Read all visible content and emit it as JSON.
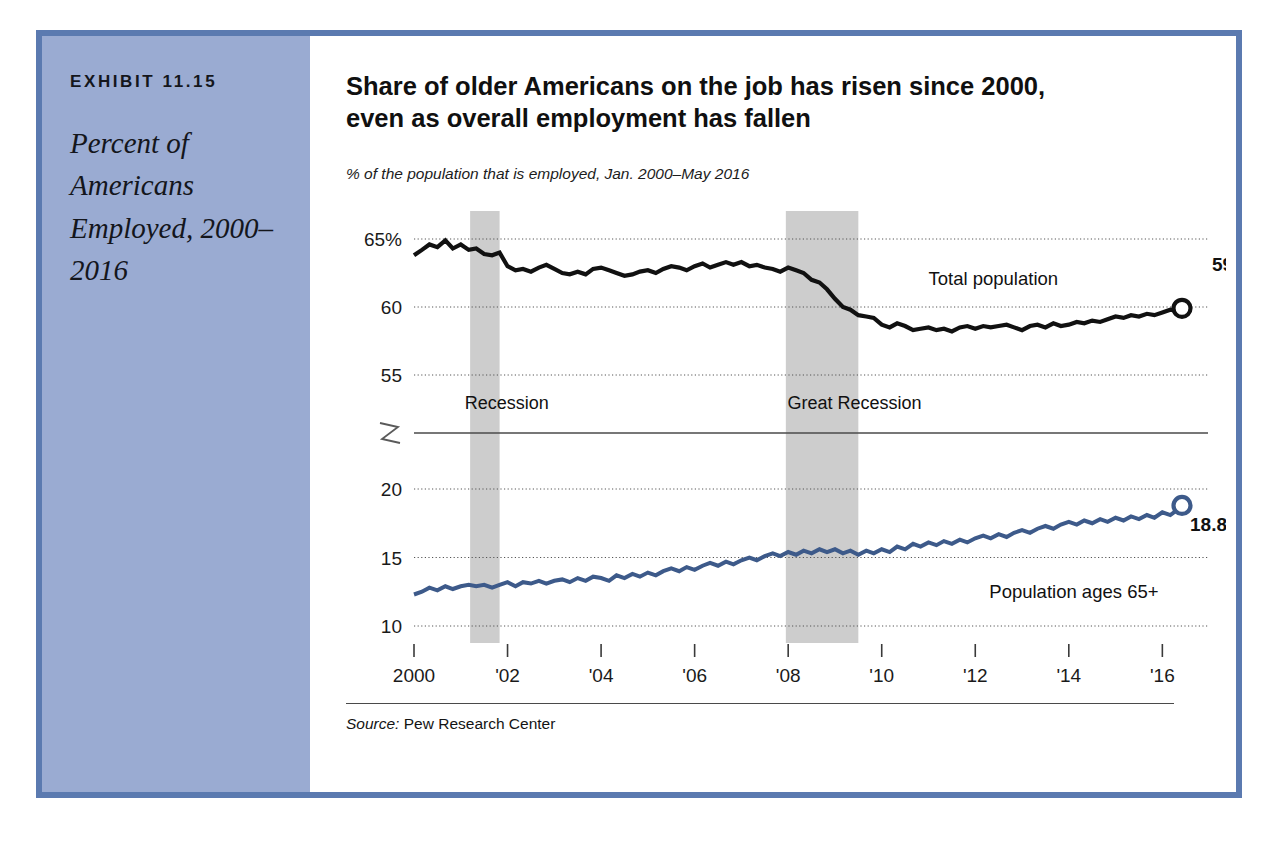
{
  "exhibit": {
    "number_label": "EXHIBIT 11.15",
    "caption": "Percent of Americans Employed, 2000–2016"
  },
  "chart": {
    "title": "Share of older Americans on the job has risen since 2000, even as overall employment has fallen",
    "subtitle": "% of the population that is employed, Jan. 2000–May 2016",
    "source_prefix": "Source:",
    "source_name": "Pew Research Center"
  },
  "colors": {
    "panel_blue": "#9aabd2",
    "frame_blue": "#5b7ab0",
    "total_line": "#111111",
    "older_line": "#3d5a8a",
    "recession_band": "#c9c9c9",
    "gridline": "#555555"
  },
  "chart_data": {
    "type": "line",
    "title": "Share of older Americans on the job has risen since 2000, even as overall employment has fallen",
    "subtitle": "% of the population that is employed, Jan. 2000–May 2016",
    "xlabel": "",
    "ylabel": "",
    "grid": true,
    "legend": "inline-labels",
    "axis_break": true,
    "xlim": [
      2000.0,
      2016.42
    ],
    "x_tick_labels": [
      "2000",
      "'02",
      "'04",
      "'06",
      "'08",
      "'10",
      "'12",
      "'14",
      "'16"
    ],
    "x_tick_values": [
      2000,
      2002,
      2004,
      2006,
      2008,
      2010,
      2012,
      2014,
      2016
    ],
    "y_upper_ticks": [
      "65%",
      "60",
      "55"
    ],
    "y_upper_tick_values": [
      65,
      60,
      55
    ],
    "y_lower_ticks": [
      "20",
      "15",
      "10"
    ],
    "y_lower_tick_values": [
      20,
      15,
      10
    ],
    "annotations": [
      {
        "text": "Recession",
        "x": 2001.0,
        "kind": "band-label"
      },
      {
        "text": "Great Recession",
        "x": 2008.2,
        "kind": "band-label"
      },
      {
        "text": "Total population",
        "x": 2011.0,
        "kind": "series-label"
      },
      {
        "text": "Population ages 65+",
        "x": 2012.3,
        "kind": "series-label"
      },
      {
        "text": "59.9%",
        "x": 2016.42,
        "kind": "end-value"
      },
      {
        "text": "18.8%",
        "x": 2016.42,
        "kind": "end-value"
      }
    ],
    "recession_bands": [
      {
        "label": "Recession",
        "start": 2001.2,
        "end": 2001.83
      },
      {
        "label": "Great Recession",
        "start": 2007.95,
        "end": 2009.5
      }
    ],
    "series": [
      {
        "name": "Total population",
        "color": "#111111",
        "end_value": "59.9%",
        "end_value_num": 59.9,
        "x": [
          2000.0,
          2000.17,
          2000.33,
          2000.5,
          2000.67,
          2000.83,
          2001.0,
          2001.17,
          2001.33,
          2001.5,
          2001.67,
          2001.83,
          2002.0,
          2002.17,
          2002.33,
          2002.5,
          2002.67,
          2002.83,
          2003.0,
          2003.17,
          2003.33,
          2003.5,
          2003.67,
          2003.83,
          2004.0,
          2004.17,
          2004.33,
          2004.5,
          2004.67,
          2004.83,
          2005.0,
          2005.17,
          2005.33,
          2005.5,
          2005.67,
          2005.83,
          2006.0,
          2006.17,
          2006.33,
          2006.5,
          2006.67,
          2006.83,
          2007.0,
          2007.17,
          2007.33,
          2007.5,
          2007.67,
          2007.83,
          2008.0,
          2008.17,
          2008.33,
          2008.5,
          2008.67,
          2008.83,
          2009.0,
          2009.17,
          2009.33,
          2009.5,
          2009.67,
          2009.83,
          2010.0,
          2010.17,
          2010.33,
          2010.5,
          2010.67,
          2010.83,
          2011.0,
          2011.17,
          2011.33,
          2011.5,
          2011.67,
          2011.83,
          2012.0,
          2012.17,
          2012.33,
          2012.5,
          2012.67,
          2012.83,
          2013.0,
          2013.17,
          2013.33,
          2013.5,
          2013.67,
          2013.83,
          2014.0,
          2014.17,
          2014.33,
          2014.5,
          2014.67,
          2014.83,
          2015.0,
          2015.17,
          2015.33,
          2015.5,
          2015.67,
          2015.83,
          2016.0,
          2016.17,
          2016.33,
          2016.42
        ],
        "y": [
          63.8,
          64.2,
          64.6,
          64.4,
          64.9,
          64.3,
          64.6,
          64.2,
          64.3,
          63.9,
          63.8,
          64.0,
          63.0,
          62.7,
          62.8,
          62.6,
          62.9,
          63.1,
          62.8,
          62.5,
          62.4,
          62.6,
          62.4,
          62.8,
          62.9,
          62.7,
          62.5,
          62.3,
          62.4,
          62.6,
          62.7,
          62.5,
          62.8,
          63.0,
          62.9,
          62.7,
          63.0,
          63.2,
          62.9,
          63.1,
          63.3,
          63.1,
          63.3,
          63.0,
          63.1,
          62.9,
          62.8,
          62.6,
          62.9,
          62.7,
          62.5,
          62.0,
          61.8,
          61.3,
          60.6,
          60.0,
          59.8,
          59.4,
          59.3,
          59.2,
          58.7,
          58.5,
          58.8,
          58.6,
          58.3,
          58.4,
          58.5,
          58.3,
          58.4,
          58.2,
          58.5,
          58.6,
          58.4,
          58.6,
          58.5,
          58.6,
          58.7,
          58.5,
          58.3,
          58.6,
          58.7,
          58.5,
          58.8,
          58.6,
          58.7,
          58.9,
          58.8,
          59.0,
          58.9,
          59.1,
          59.3,
          59.2,
          59.4,
          59.3,
          59.5,
          59.4,
          59.6,
          59.8,
          59.7,
          59.9
        ]
      },
      {
        "name": "Population ages 65+",
        "color": "#3d5a8a",
        "end_value": "18.8%",
        "end_value_num": 18.8,
        "x": [
          2000.0,
          2000.17,
          2000.33,
          2000.5,
          2000.67,
          2000.83,
          2001.0,
          2001.17,
          2001.33,
          2001.5,
          2001.67,
          2001.83,
          2002.0,
          2002.17,
          2002.33,
          2002.5,
          2002.67,
          2002.83,
          2003.0,
          2003.17,
          2003.33,
          2003.5,
          2003.67,
          2003.83,
          2004.0,
          2004.17,
          2004.33,
          2004.5,
          2004.67,
          2004.83,
          2005.0,
          2005.17,
          2005.33,
          2005.5,
          2005.67,
          2005.83,
          2006.0,
          2006.17,
          2006.33,
          2006.5,
          2006.67,
          2006.83,
          2007.0,
          2007.17,
          2007.33,
          2007.5,
          2007.67,
          2007.83,
          2008.0,
          2008.17,
          2008.33,
          2008.5,
          2008.67,
          2008.83,
          2009.0,
          2009.17,
          2009.33,
          2009.5,
          2009.67,
          2009.83,
          2010.0,
          2010.17,
          2010.33,
          2010.5,
          2010.67,
          2010.83,
          2011.0,
          2011.17,
          2011.33,
          2011.5,
          2011.67,
          2011.83,
          2012.0,
          2012.17,
          2012.33,
          2012.5,
          2012.67,
          2012.83,
          2013.0,
          2013.17,
          2013.33,
          2013.5,
          2013.67,
          2013.83,
          2014.0,
          2014.17,
          2014.33,
          2014.5,
          2014.67,
          2014.83,
          2015.0,
          2015.17,
          2015.33,
          2015.5,
          2015.67,
          2015.83,
          2016.0,
          2016.17,
          2016.33,
          2016.42
        ],
        "y": [
          12.3,
          12.5,
          12.8,
          12.6,
          12.9,
          12.7,
          12.9,
          13.0,
          12.9,
          13.0,
          12.8,
          13.0,
          13.2,
          12.9,
          13.2,
          13.1,
          13.3,
          13.1,
          13.3,
          13.4,
          13.2,
          13.5,
          13.3,
          13.6,
          13.5,
          13.3,
          13.7,
          13.5,
          13.8,
          13.6,
          13.9,
          13.7,
          14.0,
          14.2,
          14.0,
          14.3,
          14.1,
          14.4,
          14.6,
          14.4,
          14.7,
          14.5,
          14.8,
          15.0,
          14.8,
          15.1,
          15.3,
          15.1,
          15.4,
          15.2,
          15.5,
          15.3,
          15.6,
          15.4,
          15.6,
          15.3,
          15.5,
          15.2,
          15.5,
          15.3,
          15.6,
          15.4,
          15.8,
          15.6,
          16.0,
          15.8,
          16.1,
          15.9,
          16.2,
          16.0,
          16.3,
          16.1,
          16.4,
          16.6,
          16.4,
          16.7,
          16.5,
          16.8,
          17.0,
          16.8,
          17.1,
          17.3,
          17.1,
          17.4,
          17.6,
          17.4,
          17.7,
          17.5,
          17.8,
          17.6,
          17.9,
          17.7,
          18.0,
          17.8,
          18.1,
          17.9,
          18.3,
          18.1,
          18.5,
          18.8
        ]
      }
    ]
  }
}
